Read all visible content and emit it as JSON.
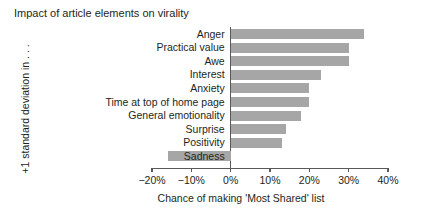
{
  "chart_data": {
    "type": "bar",
    "orientation": "horizontal",
    "title": "Impact of article elements on virality",
    "xlabel": "Chance of making 'Most Shared' list",
    "ylabel": "+1 standard deviation in . . .",
    "categories": [
      "Anger",
      "Practical value",
      "Awe",
      "Interest",
      "Anxiety",
      "Time at top of home page",
      "General emotionality",
      "Surprise",
      "Positivity",
      "Sadness"
    ],
    "values": [
      34,
      30,
      30,
      23,
      20,
      20,
      18,
      14,
      13,
      -16
    ],
    "value_unit": "%",
    "xlim": [
      -20,
      40
    ],
    "xticks": [
      -20,
      -10,
      0,
      10,
      20,
      30,
      40
    ],
    "xtick_labels": [
      "−20%",
      "−10%",
      "0%",
      "10%",
      "20%",
      "30%",
      "40%"
    ],
    "grid": false,
    "legend": null,
    "bar_color": "#a6a6a6",
    "axis_color": "#58595b",
    "text_color": "#231f20",
    "background": "#ffffff"
  }
}
